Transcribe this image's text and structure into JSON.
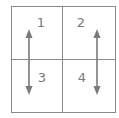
{
  "diagram": {
    "type": "2x2 grid",
    "line_color": "#8a8a8a",
    "label_color": "#7a7a7a",
    "cells": [
      {
        "label": "1",
        "position": "top-left"
      },
      {
        "label": "2",
        "position": "top-right"
      },
      {
        "label": "3",
        "position": "bottom-left"
      },
      {
        "label": "4",
        "position": "bottom-right"
      }
    ],
    "arrows": [
      {
        "name": "left-column-arrow",
        "from": "1",
        "to": "3",
        "direction": "bidirectional-vertical"
      },
      {
        "name": "right-column-arrow",
        "from": "2",
        "to": "4",
        "direction": "bidirectional-vertical"
      }
    ]
  }
}
